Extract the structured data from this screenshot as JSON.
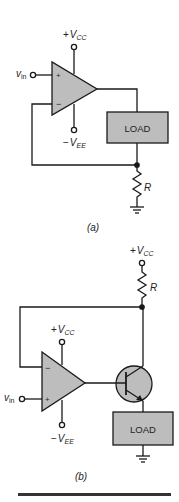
{
  "figure": {
    "a": {
      "caption": "(a)",
      "supply_pos": {
        "sign": "+",
        "v": "V",
        "sub": "CC"
      },
      "supply_neg": {
        "sign": "−",
        "v": "V",
        "sub": "EE"
      },
      "input": {
        "v": "v",
        "sub": "in"
      },
      "opamp_plus": "+",
      "opamp_minus": "−",
      "load_label": "LOAD",
      "resistor_label": "R"
    },
    "b": {
      "caption": "(b)",
      "supply_top": {
        "sign": "+",
        "v": "V",
        "sub": "CC"
      },
      "supply_pos": {
        "sign": "+",
        "v": "V",
        "sub": "CC"
      },
      "supply_neg": {
        "sign": "−",
        "v": "V",
        "sub": "EE"
      },
      "input": {
        "v": "v",
        "sub": "in"
      },
      "opamp_plus": "+",
      "opamp_minus": "−",
      "load_label": "LOAD",
      "resistor_label": "R"
    }
  },
  "colors": {
    "fill_gray": "#bdbdbd",
    "line": "#1a1a1a",
    "bar": "#333333"
  }
}
